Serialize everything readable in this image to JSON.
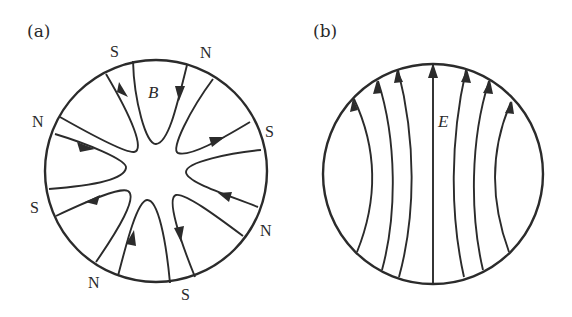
{
  "figure": {
    "panels": [
      {
        "id": "a",
        "label": "(a)",
        "field_symbol": "B",
        "description": "Magnetic field lines in a circular cross-section with alternating N/S poles around the rim",
        "circle": {
          "cx": 156,
          "cy": 171,
          "r": 111
        },
        "pole_labels": [
          {
            "text": "S",
            "x": 110,
            "y": 57
          },
          {
            "text": "N",
            "x": 206,
            "y": 58
          },
          {
            "text": "N",
            "x": 32,
            "y": 127
          },
          {
            "text": "S",
            "x": 267,
            "y": 137
          },
          {
            "text": "S",
            "x": 31,
            "y": 213
          },
          {
            "text": "N",
            "x": 262,
            "y": 236
          },
          {
            "text": "N",
            "x": 92,
            "y": 289
          },
          {
            "text": "S",
            "x": 182,
            "y": 300
          }
        ],
        "field_label_pos": {
          "x": 149,
          "y": 98
        }
      },
      {
        "id": "b",
        "label": "(b)",
        "field_symbol": "E",
        "description": "Electric field lines running bottom to top inside a circular cross-section",
        "circle": {
          "cx": 433,
          "cy": 174,
          "r": 110
        },
        "line_count": 7,
        "field_label_pos": {
          "x": 438,
          "y": 127
        }
      }
    ],
    "colors": {
      "ink": "#2b2b2b",
      "background": "#ffffff"
    }
  }
}
